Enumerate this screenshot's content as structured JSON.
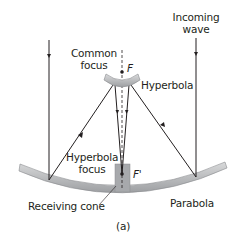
{
  "diagram": {
    "labels": {
      "incoming_wave": [
        "Incoming",
        "wave"
      ],
      "common_focus": [
        "Common",
        "focus"
      ],
      "focus_f": "F",
      "hyperbola": "Hyperbola",
      "hyperbola_focus": [
        "Hyperbola",
        "focus"
      ],
      "focus_f_prime": "F'",
      "receiving_cone": "Receiving cone",
      "parabola": "Parabola",
      "panel": "(a)"
    },
    "colors": {
      "line": "#231f20",
      "mirror": "#b3b5b8",
      "mirror_edge": "#8a8c8e",
      "cone": "#a7a9ac"
    }
  }
}
